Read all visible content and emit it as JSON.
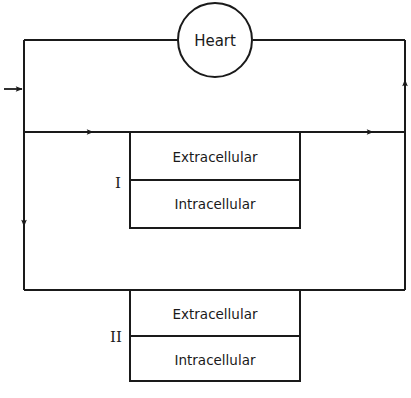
{
  "diagram": {
    "type": "circulatory compartment flow diagram",
    "line_color": "#1a1a1a",
    "background": "#ffffff",
    "heart": {
      "label": "Heart"
    },
    "compartments": [
      {
        "id": "I",
        "label": "I",
        "upper": "Extracellular",
        "lower": "Intracellular"
      },
      {
        "id": "II",
        "label": "II",
        "upper": "Extracellular",
        "lower": "Intracellular"
      }
    ],
    "flows": [
      {
        "from": "input",
        "to": "left-trunk",
        "direction": "right"
      },
      {
        "from": "left-trunk",
        "to": "compartment-I",
        "direction": "right"
      },
      {
        "from": "compartment-I",
        "to": "right-trunk",
        "direction": "right"
      },
      {
        "from": "left-trunk",
        "to": "compartment-II",
        "direction": "down"
      },
      {
        "from": "right-trunk",
        "to": "heart",
        "direction": "up"
      }
    ]
  }
}
